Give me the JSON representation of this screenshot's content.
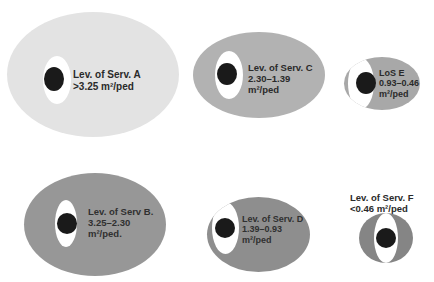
{
  "levels": {
    "A": {
      "line1": "Lev. of Serv. A",
      "line2": ">3.25 m²/ped",
      "line3": "",
      "color": "#e3e3e3"
    },
    "B": {
      "line1": "Lev. of Serv B.",
      "line2": "3.25–2.30",
      "line3": "m²/ped.",
      "color": "#979797"
    },
    "C": {
      "line1": "Lev. of Serv. C",
      "line2": "2.30–1.39",
      "line3": "m²/ped",
      "color": "#b2b2b2"
    },
    "D": {
      "line1": "Lev. of Serv. D",
      "line2": "1.39–0.93",
      "line3": "m²/ped",
      "color": "#8e8e8e"
    },
    "E": {
      "line1": "LoS E",
      "line2": "0.93–0.46",
      "line3": "m²/ped",
      "color": "#a8a8a8"
    },
    "F": {
      "line1": "Lev. of Serv. F",
      "line2": "<0.46 m²/ped",
      "line3": "",
      "color": "#858585"
    }
  }
}
